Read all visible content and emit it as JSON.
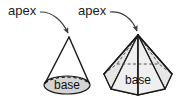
{
  "figure": {
    "background_color": "#ffffff",
    "stroke_color": "#1a1a1a",
    "arrow_color": "#3c3c3c",
    "labels": {
      "apex_left": "apex",
      "apex_right": "apex",
      "base_left": "base",
      "base_right": "base"
    },
    "shapes": [
      {
        "name": "cone",
        "apex_point": [
          69,
          37
        ],
        "base_ellipse": {
          "cx": 67,
          "cy": 85,
          "rx": 23,
          "ry": 9,
          "fill": "#d4d4d4"
        },
        "hidden_edge_style": "dashed"
      },
      {
        "name": "hexagonal-pyramid",
        "apex_point": [
          138,
          35
        ],
        "base_polygon_center": [
          138,
          80
        ],
        "base_fill": "#d9d9d9",
        "face_fill_light": "#efefef",
        "face_fill_mid": "#d0d0d0",
        "hidden_edge_style": "dashed"
      }
    ]
  }
}
